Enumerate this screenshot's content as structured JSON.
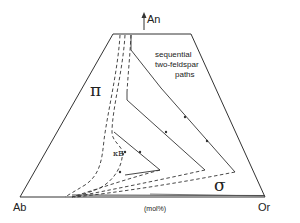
{
  "diagram": {
    "type": "ternary-section feldspar crystallization paths",
    "vertices": {
      "top": "An",
      "left": "Ab",
      "right": "Or"
    },
    "fields": {
      "plagioclase": "π",
      "alkali_feldspar": "σ"
    },
    "annotation": {
      "line1": "sequential",
      "line2": "two-feldspar",
      "line3": "paths"
    },
    "point_label": "κE",
    "units": "(mol%)",
    "colors": {
      "line": "#333333",
      "background": "#ffffff"
    }
  }
}
